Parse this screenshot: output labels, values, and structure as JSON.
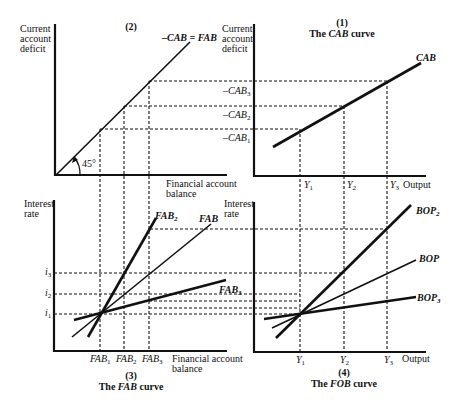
{
  "panel2": {
    "number": "(2)",
    "y_label": [
      "Current",
      "account",
      "deficit"
    ],
    "x_label": [
      "Financial account",
      "balance"
    ],
    "line_label": "–CAB = FAB",
    "angle_label": "45°"
  },
  "panel1": {
    "number": "(1)",
    "title_prefix": "The ",
    "title_italic": "CAB",
    "title_suffix": " curve",
    "y_label": [
      "Current",
      "account",
      "deficit"
    ],
    "x_label": "Output",
    "line_label": "CAB",
    "y_ticks": [
      "–CAB3",
      "–CAB2",
      "–CAB1"
    ],
    "x_ticks": [
      "Y1",
      "Y2",
      "Y3"
    ]
  },
  "panel3": {
    "number": "(3)",
    "title_prefix": "The ",
    "title_italic": "FAB",
    "title_suffix": " curve",
    "y_label": [
      "Interest",
      "rate"
    ],
    "x_label": [
      "Financial account",
      "balance"
    ],
    "y_ticks": [
      "i3",
      "i2",
      "i1"
    ],
    "x_ticks": [
      "FAB1",
      "FAB2",
      "FAB3"
    ],
    "line_labels": [
      "FAB2",
      "FAB",
      "FAB3"
    ]
  },
  "panel4": {
    "number": "(4)",
    "title_prefix": "The ",
    "title_italic": "FOB",
    "title_suffix": " curve",
    "y_label": [
      "Interest",
      "rate"
    ],
    "x_label": "Output",
    "x_ticks": [
      "Y1",
      "Y2",
      "Y3"
    ],
    "line_labels": [
      "BOP2",
      "BOP",
      "BOP3"
    ]
  }
}
